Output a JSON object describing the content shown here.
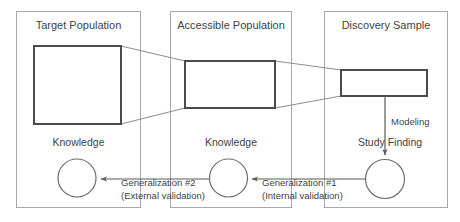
{
  "diagram": {
    "colors": {
      "panel_border": "#a8a8a8",
      "entity_border": "#4b4b4b",
      "circle_border": "#6e6e6e",
      "funnel_line": "#8d8d8d",
      "arrow": "#5a5a5a",
      "text": "#3f3f3f",
      "background": "#ffffff"
    },
    "panels": [
      {
        "id": "target-population",
        "title": "Target Population",
        "entity_label": "",
        "knowledge_label": "Knowledge"
      },
      {
        "id": "accessible-population",
        "title": "Accessible Population",
        "entity_label": "",
        "knowledge_label": "Knowledge"
      },
      {
        "id": "discovery-sample",
        "title": "Discovery Sample",
        "entity_label": "",
        "knowledge_label": "Study Finding"
      }
    ],
    "edges": [
      {
        "id": "modeling",
        "label_line1": "Modeling",
        "label_line2": "",
        "from": "discovery-sample-rect",
        "to": "study-finding-circle"
      },
      {
        "id": "generalization-1",
        "label_line1": "Generalization #1",
        "label_line2": "(Internal validation)",
        "from": "study-finding-circle",
        "to": "accessible-knowledge-circle"
      },
      {
        "id": "generalization-2",
        "label_line1": "Generalization #2",
        "label_line2": "(External validation)",
        "from": "accessible-knowledge-circle",
        "to": "target-knowledge-circle"
      }
    ]
  }
}
